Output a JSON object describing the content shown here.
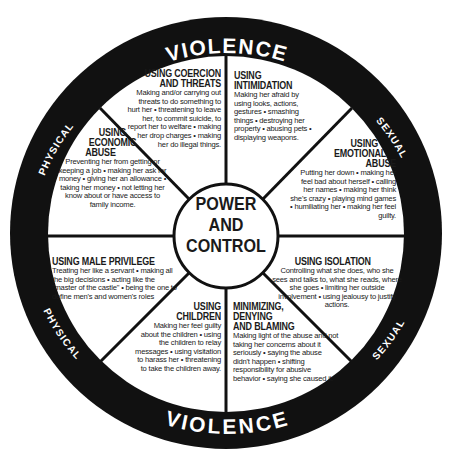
{
  "center": {
    "line1": "POWER",
    "line2": "AND",
    "line3": "CONTROL"
  },
  "rim": {
    "top": {
      "left": "PHYSICAL",
      "middle": "VIOLENCE",
      "right": "SEXUAL"
    },
    "bottom": {
      "left": "PHYSICAL",
      "middle": "VIOLENCE",
      "right": "SEXUAL"
    }
  },
  "segments": {
    "coercion": {
      "title1": "USING COERCION",
      "title2": "AND THREATS",
      "body": "Making and/or carrying out threats to do something to hurt her • threatening to leave her, to commit suicide, to report her to welfare • making her drop charges • making her do illegal things."
    },
    "intimidation": {
      "title1": "USING",
      "title2": "INTIMIDATION",
      "body": "Making her afraid by using looks, actions, gestures • smashing things • destroying her property • abusing pets • displaying weapons."
    },
    "economic": {
      "title1": "USING",
      "title2": "ECONOMIC",
      "title3": "ABUSE",
      "body": "Preventing her from getting or keeping a job • making her ask for money • giving her an allowance • taking her money • not letting her know about or have access to family income."
    },
    "emotional": {
      "title1": "USING",
      "title2": "EMOTIONAL",
      "title3": "ABUSE",
      "body": "Putting her down • making her feel bad about herself • calling her names • making her think she's crazy • playing mind games • humiliating her • making her feel guilty."
    },
    "male_privilege": {
      "title1": "USING MALE PRIVILEGE",
      "body": "Treating her like a servant • making all the big decisions • acting like the \"master of the castle\" • being the one to define men's and women's roles"
    },
    "isolation": {
      "title1": "USING ISOLATION",
      "body": "Controlling what she does, who she sees and talks to, what she reads, where she goes • limiting her outside involvement • using jealousy to justify actions."
    },
    "children": {
      "title1": "USING",
      "title2": "CHILDREN",
      "body": "Making her feel guilty about the children • using the children to relay messages • using visitation to harass her • threatening to take the children away."
    },
    "minimizing": {
      "title1": "MINIMIZING,",
      "title2": "DENYING",
      "title3": "AND BLAMING",
      "body": "Making light of the abuse and not taking her concerns about it seriously • saying the abuse didn't happen • shifting responsibility for abusive behavior • saying she caused it."
    }
  },
  "colors": {
    "ring": "#111111",
    "background": "#ffffff",
    "text": "#1a1a1a",
    "rim_text": "#ffffff"
  }
}
